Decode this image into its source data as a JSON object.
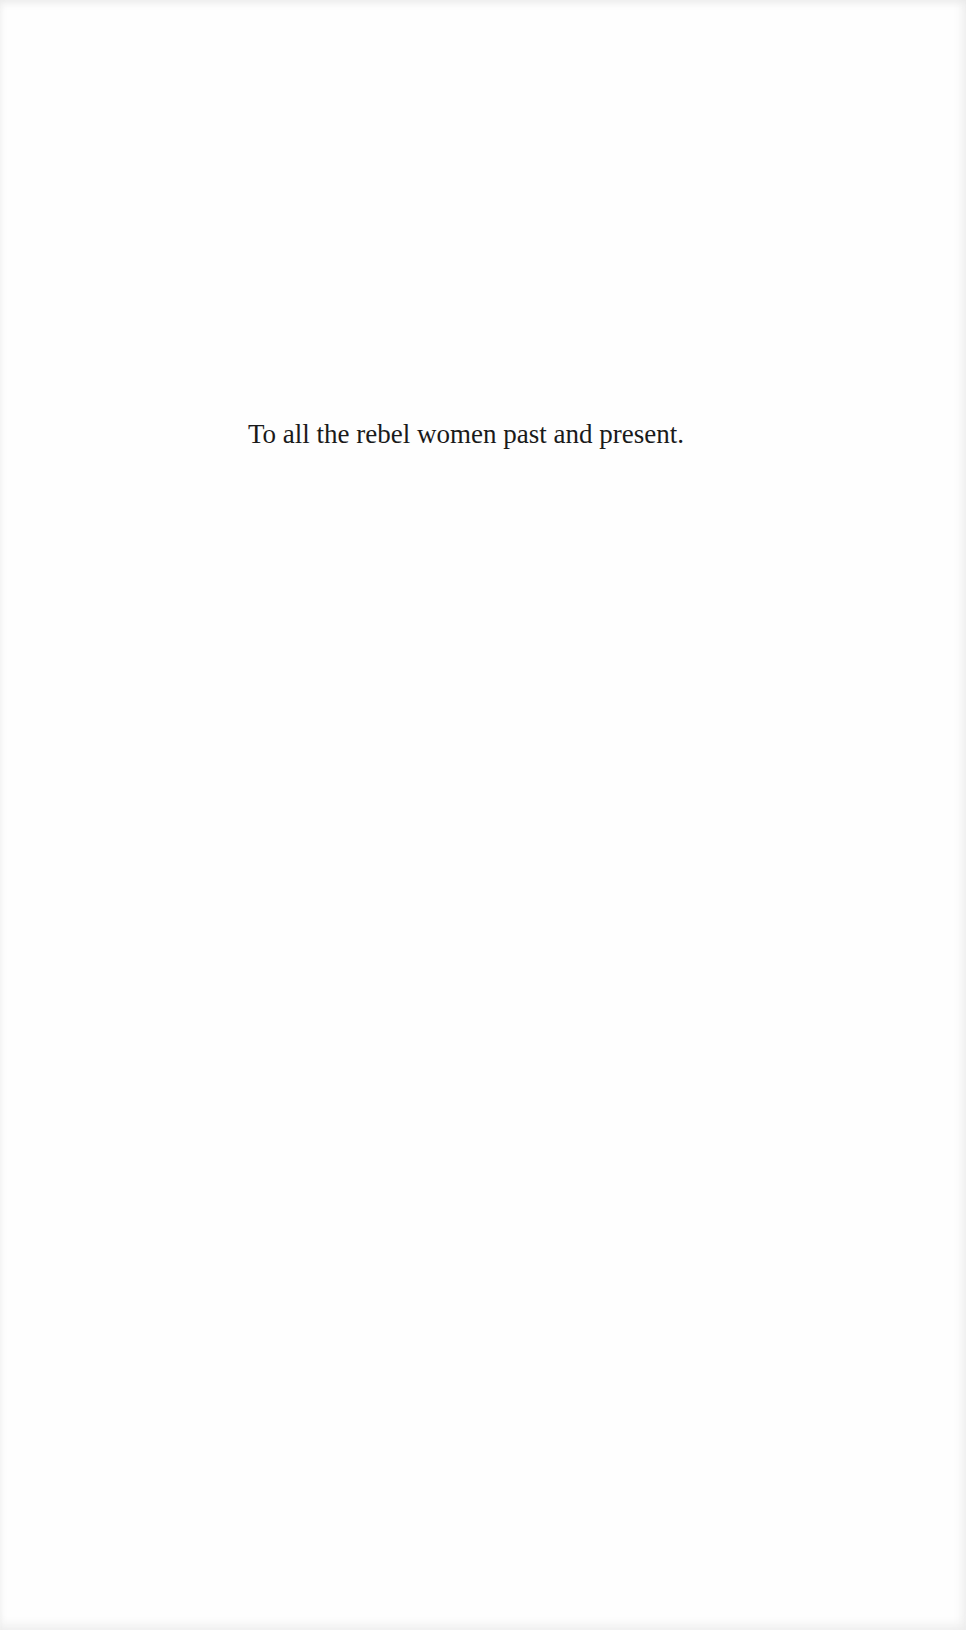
{
  "page": {
    "dedication": "To all the rebel women past and present."
  }
}
